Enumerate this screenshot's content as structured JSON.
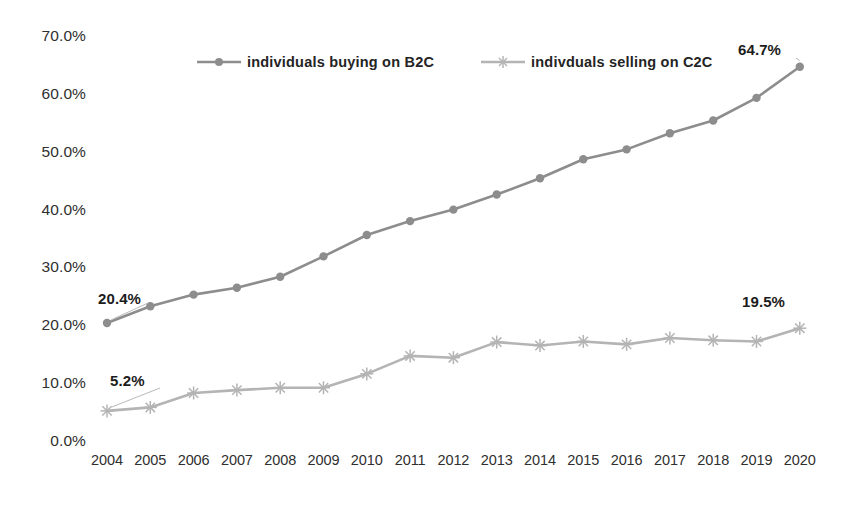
{
  "chart_data": {
    "type": "line",
    "title": "",
    "xlabel": "",
    "ylabel": "",
    "categories": [
      "2004",
      "2005",
      "2006",
      "2007",
      "2008",
      "2009",
      "2010",
      "2011",
      "2012",
      "2013",
      "2014",
      "2015",
      "2016",
      "2017",
      "2018",
      "2019",
      "2020"
    ],
    "ylim": [
      0,
      70
    ],
    "ytick_labels": [
      "70.0%",
      "60.0%",
      "50.0%",
      "40.0%",
      "30.0%",
      "20.0%",
      "10.0%",
      "0.0%"
    ],
    "ytick_values": [
      70,
      60,
      50,
      40,
      30,
      20,
      10,
      0
    ],
    "grid": false,
    "legend_position": "top-center",
    "series": [
      {
        "name": "individuals buying on B2C",
        "color": "#8d8d8d",
        "marker": "circle",
        "values": [
          20.4,
          23.3,
          25.3,
          26.5,
          28.4,
          31.9,
          35.6,
          38.0,
          40.0,
          42.6,
          45.4,
          48.7,
          50.4,
          53.2,
          55.4,
          59.3,
          64.7
        ]
      },
      {
        "name": "indivduals selling on C2C",
        "color": "#b4b4b4",
        "marker": "star",
        "values": [
          5.2,
          5.8,
          8.3,
          8.8,
          9.2,
          9.2,
          11.6,
          14.7,
          14.4,
          17.1,
          16.5,
          17.2,
          16.7,
          17.8,
          17.4,
          17.2,
          19.5
        ]
      }
    ],
    "annotations": [
      {
        "id": "b2c-first",
        "text": "20.4%",
        "series": "individuals buying on B2C",
        "category": "2004"
      },
      {
        "id": "c2c-first",
        "text": "5.2%",
        "series": "indivduals selling on C2C",
        "category": "2004"
      },
      {
        "id": "b2c-last",
        "text": "64.7%",
        "series": "individuals buying on B2C",
        "category": "2020"
      },
      {
        "id": "c2c-last",
        "text": "19.5%",
        "series": "indivduals selling on C2C",
        "category": "2020"
      }
    ]
  },
  "legend": {
    "entries": [
      {
        "label": "individuals buying on B2C",
        "color": "#8d8d8d",
        "marker": "circle"
      },
      {
        "label": "indivduals selling on C2C",
        "color": "#b4b4b4",
        "marker": "star"
      }
    ]
  }
}
